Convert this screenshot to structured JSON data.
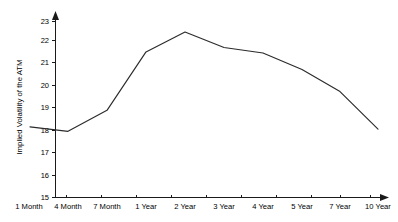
{
  "chart_data": {
    "type": "line",
    "title": "",
    "subtitle": "",
    "xlabel": "",
    "ylabel": "Implied Volatility of the ATM",
    "categories": [
      "1 Month",
      "4 Month",
      "7 Month",
      "1 Year",
      "2 Year",
      "3 Year",
      "4 Year",
      "5 Year",
      "7 Year",
      "10 Year"
    ],
    "values": [
      18.2,
      18.0,
      18.95,
      21.6,
      22.5,
      21.8,
      21.55,
      20.8,
      19.8,
      18.1
    ],
    "series": [
      {
        "name": "Implied Volatility of the ATM",
        "values": [
          18.2,
          18.0,
          18.95,
          21.6,
          22.5,
          21.8,
          21.55,
          20.8,
          19.8,
          18.1
        ]
      }
    ],
    "ylim": [
      15,
      23
    ],
    "ytick_labels": [
      "15",
      "16",
      "17",
      "18",
      "19",
      "20",
      "21",
      "22",
      "23"
    ],
    "ytick_values": [
      15,
      16,
      17,
      18,
      19,
      20,
      21,
      22,
      23
    ],
    "xtick_labels": [
      "1 Month",
      "4 Month",
      "7 Month",
      "1 Year",
      "2 Year",
      "3 Year",
      "4 Year",
      "5 Year",
      "7 Year",
      "10 Year"
    ],
    "grid": false,
    "legend": false,
    "legend_position": "none",
    "line_color": "#2b2b2b",
    "axis_color": "#1a1a1a",
    "background_color": "#ffffff",
    "annotations": []
  }
}
